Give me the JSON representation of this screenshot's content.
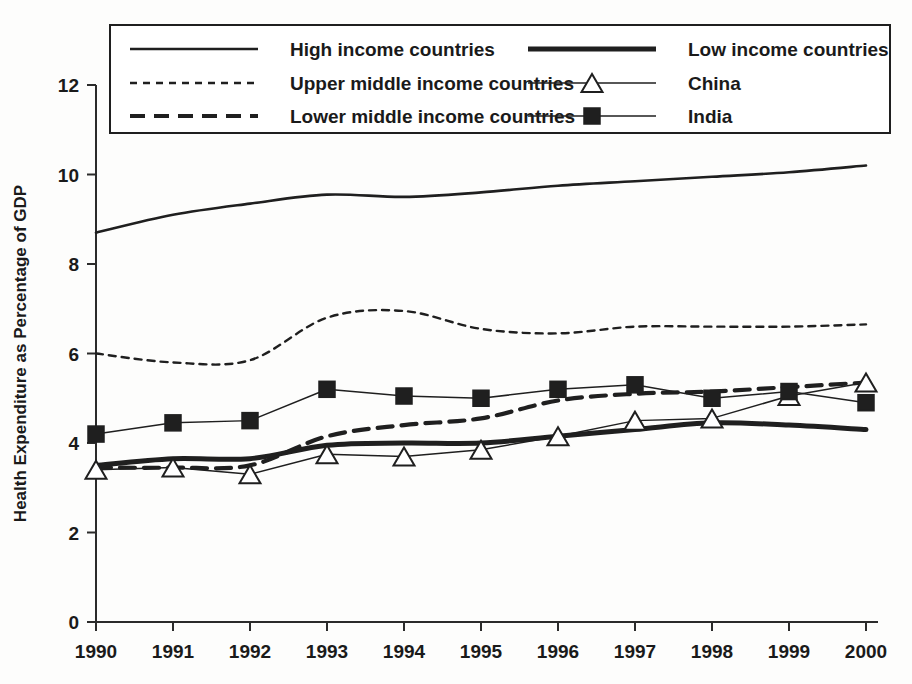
{
  "chart_data": {
    "type": "line",
    "title": "",
    "xlabel": "",
    "ylabel": "Health Expenditure as Percentage of GDP",
    "x": [
      1990,
      1991,
      1992,
      1993,
      1994,
      1995,
      1996,
      1997,
      1998,
      1999,
      2000
    ],
    "xticklabels": [
      "1990",
      "1991",
      "1992",
      "1993",
      "1994",
      "1995",
      "1996",
      "1997",
      "1998",
      "1999",
      "2000"
    ],
    "yticklabels": [
      "0",
      "2",
      "4",
      "6",
      "8",
      "10",
      "12"
    ],
    "yticks": [
      0,
      2,
      4,
      6,
      8,
      10,
      12
    ],
    "xlim": [
      1990,
      2000
    ],
    "ylim": [
      0,
      12
    ],
    "grid": false,
    "legend_position": "top",
    "series": [
      {
        "name": "High income countries",
        "style": "solid",
        "marker": "none",
        "values": [
          8.7,
          9.1,
          9.35,
          9.55,
          9.5,
          9.6,
          9.75,
          9.85,
          9.95,
          10.05,
          10.2
        ]
      },
      {
        "name": "Upper middle income countries",
        "style": "dotted",
        "marker": "none",
        "values": [
          6.0,
          5.8,
          5.85,
          6.8,
          6.95,
          6.55,
          6.45,
          6.6,
          6.6,
          6.6,
          6.65
        ]
      },
      {
        "name": "Lower middle income countries",
        "style": "dashed",
        "marker": "none",
        "values": [
          3.45,
          3.45,
          3.5,
          4.15,
          4.4,
          4.55,
          4.95,
          5.1,
          5.15,
          5.25,
          5.35
        ]
      },
      {
        "name": "Low income countries",
        "style": "thick-solid",
        "marker": "none",
        "values": [
          3.5,
          3.65,
          3.65,
          3.95,
          4.0,
          4.0,
          4.15,
          4.3,
          4.45,
          4.4,
          4.3
        ]
      },
      {
        "name": "China",
        "style": "thin-solid",
        "marker": "triangle",
        "values": [
          3.4,
          3.45,
          3.3,
          3.75,
          3.7,
          3.85,
          4.15,
          4.5,
          4.55,
          5.05,
          5.35
        ]
      },
      {
        "name": "India",
        "style": "thin-solid",
        "marker": "square",
        "values": [
          4.2,
          4.45,
          4.5,
          5.2,
          5.05,
          5.0,
          5.2,
          5.3,
          5.0,
          5.15,
          4.9
        ]
      }
    ],
    "legend": [
      {
        "label": "High income countries",
        "style": "solid",
        "marker": "none"
      },
      {
        "label": "Low income countries",
        "style": "thick-solid",
        "marker": "none"
      },
      {
        "label": "Upper middle income countries",
        "style": "dotted",
        "marker": "none"
      },
      {
        "label": "China",
        "style": "thin-solid",
        "marker": "triangle"
      },
      {
        "label": "Lower middle income countries",
        "style": "dashed",
        "marker": "none"
      },
      {
        "label": "India",
        "style": "thin-solid",
        "marker": "square"
      }
    ],
    "colors": {
      "ink": "#1f1f1f",
      "axis": "#2b2b2b",
      "background": "#fdfdfc"
    }
  }
}
